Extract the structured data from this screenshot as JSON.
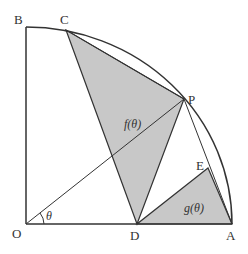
{
  "diagram": {
    "type": "geometry-quarter-circle",
    "colors": {
      "shade": "#c8c8c8",
      "stroke": "#333333",
      "background": "#ffffff"
    },
    "points": {
      "O": {
        "label": "O",
        "x": 26,
        "y": 224
      },
      "A": {
        "label": "A",
        "x": 232,
        "y": 224
      },
      "B": {
        "label": "B",
        "x": 26,
        "y": 27
      },
      "C": {
        "label": "C",
        "x": 66,
        "y": 30
      },
      "P": {
        "label": "P",
        "x": 184,
        "y": 99
      },
      "D": {
        "label": "D",
        "x": 137,
        "y": 224
      },
      "E": {
        "label": "E",
        "x": 208,
        "y": 168
      }
    },
    "labels": {
      "theta": "θ",
      "f": "f(θ)",
      "g": "g(θ)"
    }
  }
}
